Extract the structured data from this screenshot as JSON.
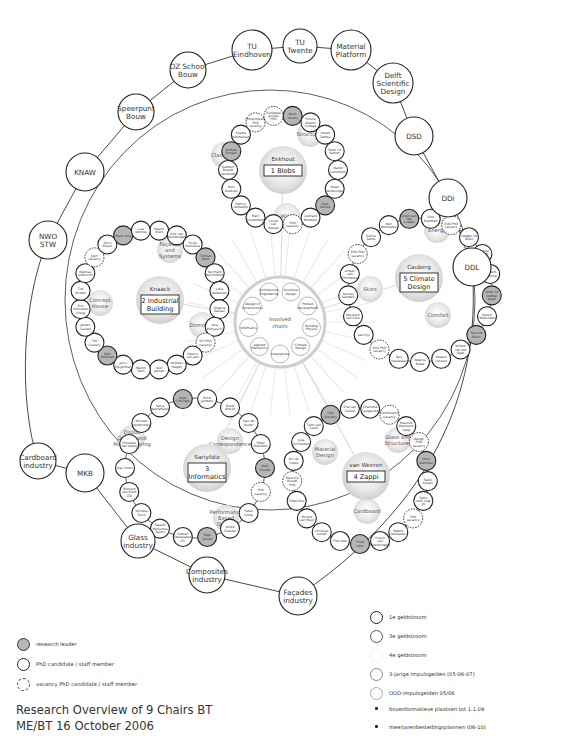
{
  "title": {
    "line1": "Research Overview of 9 Chairs BT",
    "line2": "ME/BT  16 October 2006"
  },
  "colors": {
    "research_leader_fill": "#b5b5b5",
    "outline": "#222222",
    "topic_fill": "#e6e6e6",
    "line": "#333333",
    "faint_line": "#dddddd"
  },
  "outer_ring": [
    {
      "label": "TU Eindhoven",
      "lines": [
        "TU",
        "Eindhoven"
      ]
    },
    {
      "label": "TU Twente",
      "lines": [
        "TU",
        "Twente"
      ]
    },
    {
      "label": "Material Platform",
      "lines": [
        "Material",
        "Platform"
      ]
    },
    {
      "label": "Delft Scientific Design",
      "lines": [
        "Delft",
        "Scientific",
        "Design"
      ]
    },
    {
      "label": "DSD",
      "lines": [
        "DSD"
      ]
    },
    {
      "label": "DDi",
      "lines": [
        "DDi"
      ]
    },
    {
      "label": "DDL",
      "lines": [
        "DDL"
      ]
    },
    {
      "label": "Façades industry",
      "lines": [
        "Façades",
        "industry"
      ]
    },
    {
      "label": "Composites industry",
      "lines": [
        "Composites",
        "industry"
      ]
    },
    {
      "label": "Glass industry",
      "lines": [
        "Glass",
        "industry"
      ]
    },
    {
      "label": "MKB",
      "lines": [
        "MKB"
      ]
    },
    {
      "label": "Cardboard industry",
      "lines": [
        "Cardboard",
        "industry"
      ]
    },
    {
      "label": "NWO STW",
      "lines": [
        "NWO",
        "STW"
      ]
    },
    {
      "label": "KNAW",
      "lines": [
        "KNAW"
      ]
    },
    {
      "label": "Speerpunt Bouw",
      "lines": [
        "Speerpunt",
        "Bouw"
      ]
    },
    {
      "label": "OZ School Bouw",
      "lines": [
        "OZ School",
        "Bouw"
      ]
    }
  ],
  "chairs": [
    {
      "id": "blobs",
      "leader": "Eekhout",
      "name": "1 Blobs",
      "topics": [
        "Claddings",
        "Structures",
        "Wind"
      ],
      "members": [
        "Karel Vollers",
        "Pursila Sharon Lundge",
        "Yuwan Tsebou",
        "Peter vd Batten",
        "Walter Lanfertom",
        "Dean Vanetsinger",
        "Hubi Stonen",
        "Leonard Broekers",
        "PhD vacancy",
        "Coline van Wessel",
        "Marc Schoenberg",
        "Martijn Veltkamp",
        "Hein Goetsen",
        "Gerbert Brandt Vanwood",
        "Andrew Borgart",
        "Shahla Rahmanian",
        "Protocoljeste PhD vacancy",
        "Europese prijzen PhD"
      ]
    },
    {
      "id": "industrial-building",
      "leader": "Knaack",
      "name": "2 Industrial Building",
      "topics": [
        "Façades and Systems",
        "Concept House",
        "Domotica"
      ],
      "members": [
        "Maarit Bilen",
        "Dirk van Zalinburgen",
        "Silvia Stanikova",
        "Tillman Klein",
        "Reinhard Marrindhen",
        "Lidia Badarnah",
        "Shapira Datsan",
        "Ana Brinjasicic",
        "ICS PhD vacancy",
        "Dennis van Jets",
        "Andreas Hägler",
        "Stef Jansen",
        "Martin Tanis",
        "Jan's Meijerman",
        "Wim Poelman",
        "Tim Calvary",
        "Jeroen Cassen",
        "Erik Hooiveen Sleyg",
        "Tim Wisten",
        "Mathias Onstricht",
        "Joeri vacancy",
        "Sorin Braun",
        "Mark Voss",
        "Lisa Ventres"
      ]
    },
    {
      "id": "informatics",
      "leader": "Sariyildiz",
      "name": "3 Informatics",
      "topics": [
        "Digital Design and Manufacturing",
        "Design Correspondence",
        "Performance Based Design"
      ],
      "members": [
        "Ernst Jambers",
        "Ruud Altkien",
        "Paul de Ruiter",
        "Peter Boeremo",
        "Rudi Stouffs",
        "PhD vacancy",
        "Fabio Urrea",
        "Andre Chaszar",
        "Bige Tunçer",
        "Sidwan Ghazalabani LTC",
        "Takashi Matsunoa Kyoto",
        "Michela Turrin",
        "Bernard van Blom LTD",
        "Bas Vloon",
        "Prospera Van Alphe",
        "Michael Veltenchers",
        "Sanja Karnamano",
        "Ozer Ciftcioglu"
      ]
    },
    {
      "id": "zappi",
      "leader": "van Weeren",
      "name": "4 Zappi",
      "topics": [
        "Material Design",
        "Glass and Structures",
        "Cardboard"
      ],
      "members": [
        "Charlotte Langeveld",
        "Certification vacancy",
        "Maurice Bokhoorn Ilang",
        "design PhD vacancy",
        "Mein Kamman",
        "Fabio Klasen",
        "Fabio Verh vogl JD",
        "PhD vacancy",
        "Robert Renkama",
        "Crecio van Keeveringen",
        "Fruid Veer",
        "Free Noe",
        "Christian Louter",
        "Michiel van Muur",
        "Freek Bos",
        "Mauricio Krasdt PhD vacancy",
        "Rui de Vreke",
        "Julia Schreudon",
        "Tjerk van Lexel",
        "Piet Stevens",
        "Erie van Cauter"
      ]
    },
    {
      "id": "climate-design",
      "leader": "Cauberg",
      "name": "5 Climate Design",
      "topics": [
        "Energy",
        "Skins",
        "Comfort"
      ],
      "members": [
        "Elke Bladman",
        "EOS PhD vacancy",
        "Hedger vd Boeit",
        "Sjaakste Sekeppi yuran",
        "Gerbert Kentnoe",
        "Andy vd Dobbel staan",
        "Martin Tenpsneke",
        "Titus de Bruin",
        "Willem van der Spek",
        "Rosaco Locesro",
        "Regina Bokel",
        "Bas Hasselaar",
        "EOS PhD vacancy",
        "Lee Hijs",
        "Marjolein van Esch",
        "Stanley Kanders",
        "Ardjan van Timmeren",
        "EOS PhD vacancy",
        "Kleine Sathe",
        "Ben Bronsema",
        "Arjen van der Linden"
      ]
    }
  ],
  "center": {
    "label": "Involved chairs",
    "satellites": [
      "Architectural Engineering",
      "Structural Design",
      "Product Development",
      "Building Physics",
      "Climate Design",
      "Installations",
      "Applied Mechanics",
      "Informatics",
      "Design of Constructions"
    ]
  },
  "legend_left": [
    {
      "key": "research-leader",
      "label": "research leader"
    },
    {
      "key": "phd-staff",
      "label": "PhD candidate / staff member"
    },
    {
      "key": "vacancy",
      "label": "vacancy PhD candidate / staff member"
    }
  ],
  "legend_right": [
    {
      "key": "1e",
      "label": "1e geldstroom"
    },
    {
      "key": "3e",
      "label": "3e geldstroom"
    },
    {
      "key": "4e",
      "label": "4e geldstroom"
    },
    {
      "key": "3jarige",
      "label": "3-jarige impulsgelden (05-06-07)"
    },
    {
      "key": "ood",
      "label": "OOD-impulsgelden 05/06"
    },
    {
      "key": "dot1",
      "label": "bovenformatieve plaatsen tot 1.1.09"
    },
    {
      "key": "dot2",
      "label": "meerjarenbestedingsplannen (06-10)"
    }
  ]
}
